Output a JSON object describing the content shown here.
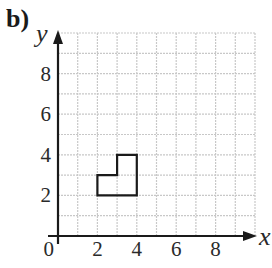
{
  "part_label": "b)",
  "axes": {
    "x_label": "x",
    "y_label": "y",
    "origin_label": "0",
    "x_ticks": [
      "2",
      "4",
      "6",
      "8"
    ],
    "y_ticks": [
      "2",
      "4",
      "6",
      "8"
    ],
    "x_range": [
      0,
      10
    ],
    "y_range": [
      0,
      10
    ],
    "grid": true
  },
  "shape": {
    "name": "L-shape",
    "vertices": [
      [
        2,
        2
      ],
      [
        4,
        2
      ],
      [
        4,
        4
      ],
      [
        3,
        4
      ],
      [
        3,
        3
      ],
      [
        2,
        3
      ]
    ]
  },
  "colors": {
    "grid": "#c8c8c8",
    "axis": "#1a1a1a",
    "shape": "#1a1a1a"
  }
}
